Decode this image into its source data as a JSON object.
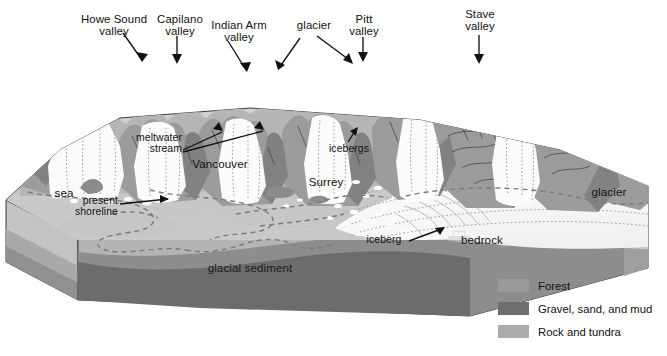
{
  "figure": {
    "kind": "block-diagram",
    "caption": "",
    "labels_top": [
      {
        "id": "howe-sound-valley",
        "text_line1": "Howe Sound",
        "text_line2": "valley"
      },
      {
        "id": "capilano-valley",
        "text_line1": "Capilano",
        "text_line2": "valley"
      },
      {
        "id": "indian-arm-valley",
        "text_line1": "Indian Arm",
        "text_line2": "valley"
      },
      {
        "id": "glacier-top",
        "text_line1": "glacier",
        "text_line2": ""
      },
      {
        "id": "pitt-valley",
        "text_line1": "Pitt",
        "text_line2": "valley"
      },
      {
        "id": "stave-valley",
        "text_line1": "Stave",
        "text_line2": "valley"
      }
    ],
    "labels_inner": [
      {
        "id": "meltwater-stream",
        "text_line1": "meltwater",
        "text_line2": "stream"
      },
      {
        "id": "icebergs",
        "text_line1": "icebergs",
        "text_line2": ""
      },
      {
        "id": "vancouver",
        "text_line1": "Vancouver",
        "text_line2": ""
      },
      {
        "id": "surrey",
        "text_line1": "Surrey",
        "text_line2": ""
      },
      {
        "id": "sea",
        "text_line1": "sea",
        "text_line2": ""
      },
      {
        "id": "present-shoreline",
        "text_line1": "present",
        "text_line2": "shoreline"
      },
      {
        "id": "glacier-right",
        "text_line1": "glacier",
        "text_line2": ""
      },
      {
        "id": "iceberg",
        "text_line1": "iceberg",
        "text_line2": ""
      },
      {
        "id": "bedrock",
        "text_line1": "bedrock",
        "text_line2": ""
      },
      {
        "id": "glacial-sediment",
        "text_line1": "glacial sediment",
        "text_line2": ""
      }
    ],
    "legend": {
      "items": [
        {
          "label": "Forest",
          "color": "#9a9a9a"
        },
        {
          "label": "Gravel, sand, and mud",
          "color": "#6f6f6f"
        },
        {
          "label": "Rock and tundra",
          "color": "#ababab"
        }
      ]
    },
    "palette": {
      "mountain_forest": "#9b9b9b",
      "mountain_dark": "#7c7c7c",
      "mountain_light": "#b3b3b3",
      "ice_white": "#fdfdfd",
      "lowland": "#c9c9c9",
      "lowland_shadow": "#bdbdbd",
      "side_face_top": "#c4c4c4",
      "side_face_mid": "#a4a4a4",
      "bedrock": "#8e8e8e",
      "glacial_sediment": "#6d6d6d",
      "outline": "#2b2b2b",
      "text": "#111111"
    }
  }
}
